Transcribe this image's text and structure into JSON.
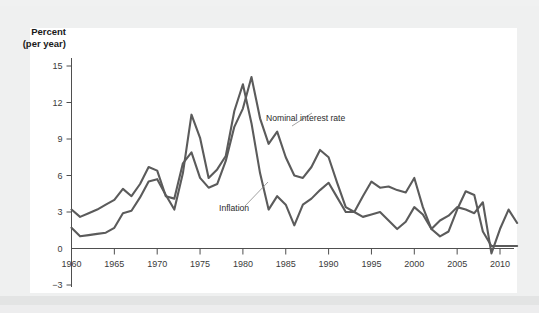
{
  "figure": {
    "background_color": "#eff0f0",
    "panel_color": "#ffffff",
    "line_color": "#5b5b5b"
  },
  "labels": {
    "y_axis_line1": "Percent",
    "y_axis_line2": "(per year)",
    "series_nominal": "Nominal interest rate",
    "series_inflation": "Inflation"
  },
  "chart_data": {
    "type": "line",
    "title": "",
    "xlabel": "",
    "ylabel": "Percent (per year)",
    "xlim": [
      1959,
      2013
    ],
    "ylim": [
      -3,
      16.5
    ],
    "yticks": [
      -3,
      0,
      3,
      6,
      9,
      12,
      15
    ],
    "ytick_labels": [
      "−3",
      "0",
      "3",
      "6",
      "9",
      "12",
      "15"
    ],
    "xticks": [
      1960,
      1965,
      1970,
      1975,
      1980,
      1985,
      1990,
      1995,
      2000,
      2005,
      2010
    ],
    "xtick_labels": [
      "1960",
      "1965",
      "1970",
      "1975",
      "1980",
      "1985",
      "1990",
      "1995",
      "2000",
      "2005",
      "2010"
    ],
    "grid": false,
    "legend_position": "inline-annotations",
    "x": [
      1960,
      1961,
      1962,
      1963,
      1964,
      1965,
      1966,
      1967,
      1968,
      1969,
      1970,
      1971,
      1972,
      1973,
      1974,
      1975,
      1976,
      1977,
      1978,
      1979,
      1980,
      1981,
      1982,
      1983,
      1984,
      1985,
      1986,
      1987,
      1988,
      1989,
      1990,
      1991,
      1992,
      1993,
      1994,
      1995,
      1996,
      1997,
      1998,
      1999,
      2000,
      2001,
      2002,
      2003,
      2004,
      2005,
      2006,
      2007,
      2008,
      2009,
      2010,
      2011,
      2012
    ],
    "series": [
      {
        "name": "Nominal interest rate",
        "values": [
          3.2,
          2.6,
          2.9,
          3.2,
          3.6,
          4.0,
          4.9,
          4.3,
          5.3,
          6.7,
          6.4,
          4.3,
          4.1,
          7.0,
          7.9,
          5.8,
          5.0,
          5.3,
          7.2,
          10.0,
          11.5,
          14.1,
          10.7,
          8.6,
          9.6,
          7.5,
          6.0,
          5.8,
          6.7,
          8.1,
          7.5,
          5.4,
          3.4,
          3.0,
          4.3,
          5.5,
          5.0,
          5.1,
          4.8,
          4.6,
          5.8,
          3.4,
          1.6,
          1.0,
          1.4,
          3.2,
          4.7,
          4.4,
          1.4,
          0.2,
          0.2,
          0.2,
          0.2
        ]
      },
      {
        "name": "Inflation",
        "values": [
          1.7,
          1.0,
          1.1,
          1.2,
          1.3,
          1.7,
          2.9,
          3.1,
          4.2,
          5.5,
          5.7,
          4.4,
          3.2,
          6.2,
          11.0,
          9.1,
          5.8,
          6.5,
          7.6,
          11.3,
          13.5,
          10.3,
          6.2,
          3.2,
          4.3,
          3.6,
          1.9,
          3.6,
          4.1,
          4.8,
          5.4,
          4.2,
          3.0,
          3.0,
          2.6,
          2.8,
          3.0,
          2.3,
          1.6,
          2.2,
          3.4,
          2.8,
          1.6,
          2.3,
          2.7,
          3.4,
          3.2,
          2.9,
          3.8,
          -0.4,
          1.6,
          3.2,
          2.1
        ]
      }
    ],
    "annotations": [
      {
        "text": "Nominal interest rate",
        "x": 1985,
        "y": 9.6
      },
      {
        "text": "Inflation",
        "x": 1976.5,
        "y": 2.6
      }
    ]
  }
}
